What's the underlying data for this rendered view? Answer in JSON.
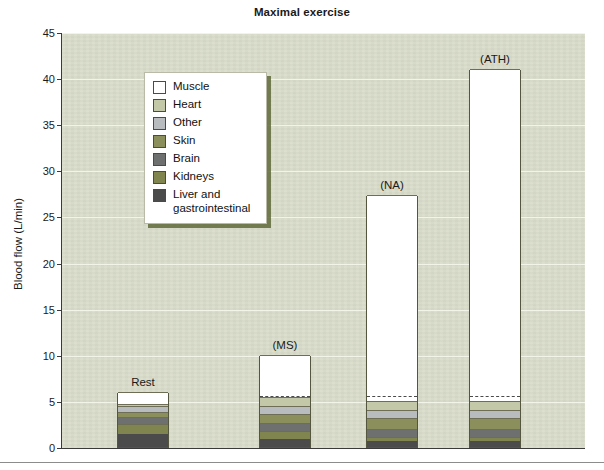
{
  "chart_data": {
    "type": "bar",
    "subtype": "stacked-bar",
    "title": "Maximal exercise",
    "xlabel": "",
    "ylabel": "Blood flow (L/min)",
    "ylim": [
      0,
      45
    ],
    "ytick_step": 5,
    "yticks": [
      "45",
      "40",
      "35",
      "30",
      "25",
      "20",
      "15",
      "10",
      "5",
      "0"
    ],
    "grid": true,
    "legend_position": "upper-left-inside",
    "categories": [
      "Rest",
      "(MS)",
      "(NA)",
      "(ATH)"
    ],
    "series": [
      {
        "name": "Liver and gastrointestinal",
        "color": "#4b4b4b",
        "values": [
          1.4,
          0.9,
          0.6,
          0.6
        ]
      },
      {
        "name": "Kidneys",
        "color": "#80844f",
        "values": [
          1.1,
          0.8,
          0.5,
          0.5
        ]
      },
      {
        "name": "Brain",
        "color": "#6e7070",
        "values": [
          0.8,
          0.9,
          0.9,
          0.9
        ]
      },
      {
        "name": "Skin",
        "color": "#8b8f5c",
        "values": [
          0.5,
          1.0,
          1.1,
          1.1
        ]
      },
      {
        "name": "Other",
        "color": "#b9bcbe",
        "values": [
          0.6,
          0.9,
          0.9,
          0.9
        ]
      },
      {
        "name": "Heart",
        "color": "#c3c8a8",
        "values": [
          0.3,
          0.9,
          1.0,
          1.0
        ]
      },
      {
        "name": "Muscle",
        "color": "#ffffff",
        "values": [
          1.3,
          4.6,
          22.3,
          36.0
        ]
      }
    ],
    "totals": [
      6.0,
      10.0,
      27.3,
      41.0
    ],
    "annotations": [
      {
        "label": "dashed reference line at top of non-muscle stack",
        "bars": [
          "(MS)",
          "(NA)",
          "(ATH)"
        ],
        "value": 5.4
      }
    ]
  },
  "legend": {
    "items": [
      {
        "label": "Muscle",
        "color": "#ffffff"
      },
      {
        "label": "Heart",
        "color": "#c3c8a8"
      },
      {
        "label": "Other",
        "color": "#b9bcbe"
      },
      {
        "label": "Skin",
        "color": "#8b8f5c"
      },
      {
        "label": "Brain",
        "color": "#6e7070"
      },
      {
        "label": "Kidneys",
        "color": "#80844f"
      },
      {
        "label": "Liver and gastrointestinal",
        "color": "#4b4b4b"
      }
    ]
  },
  "colors": {
    "plot_background": "#d7dbc8",
    "gridline": "#f2f4ea",
    "axis": "#3a3a3a",
    "text": "#1a1a1a",
    "legend_shadow": "#60683a"
  }
}
